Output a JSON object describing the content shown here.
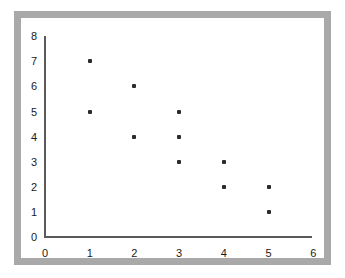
{
  "chart_data": {
    "type": "scatter",
    "title": "",
    "subtitle": "",
    "xlabel": "",
    "ylabel": "",
    "xlim": [
      0,
      6
    ],
    "ylim": [
      0,
      8
    ],
    "x_ticks": [
      0,
      1,
      2,
      3,
      4,
      5,
      6
    ],
    "y_ticks": [
      0,
      1,
      2,
      3,
      4,
      5,
      6,
      7,
      8
    ],
    "x_tick_labels": [
      "0",
      "1",
      "2",
      "3",
      "4",
      "5",
      "6"
    ],
    "y_tick_labels": [
      "0",
      "1",
      "2",
      "3",
      "4",
      "5",
      "6",
      "7",
      "8"
    ],
    "grid": false,
    "legend": false,
    "legend_position": "none",
    "annotations": [],
    "marker": {
      "shape": "square-dot",
      "color": "#2b2b2b",
      "size_px": 4
    },
    "series": [
      {
        "name": "",
        "points": [
          {
            "x": 1,
            "y": 7
          },
          {
            "x": 1,
            "y": 5
          },
          {
            "x": 2,
            "y": 6
          },
          {
            "x": 2,
            "y": 4
          },
          {
            "x": 3,
            "y": 5
          },
          {
            "x": 3,
            "y": 4
          },
          {
            "x": 3,
            "y": 3
          },
          {
            "x": 4,
            "y": 3
          },
          {
            "x": 4,
            "y": 2
          },
          {
            "x": 5,
            "y": 2
          },
          {
            "x": 5,
            "y": 1
          }
        ]
      }
    ]
  },
  "style": {
    "frame_color": "#a9a9a9",
    "axis_color": "#5a5a5a",
    "background_color": "#ffffff",
    "text_color": "#1a1a1a"
  }
}
